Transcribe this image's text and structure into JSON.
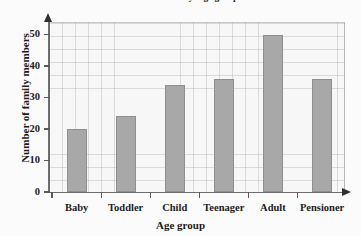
{
  "chart_data": {
    "type": "bar",
    "title": "Numbers in family: age groups",
    "xlabel": "Age group",
    "ylabel": "Number of family members",
    "categories": [
      "Baby",
      "Toddler",
      "Child",
      "Teenager",
      "Adult",
      "Pensioner"
    ],
    "values": [
      20,
      24,
      34,
      36,
      50,
      36
    ],
    "ylim": [
      0,
      54
    ],
    "ytick_labels": [
      "0",
      "10",
      "20",
      "30",
      "40",
      "50"
    ],
    "ytick_values": [
      0,
      10,
      20,
      30,
      40,
      50
    ],
    "grid": true,
    "grid_minor_step": 2,
    "legend": null,
    "bar_color": "#a8a8a8",
    "bar_edge_color": "#8e8e8e",
    "plot_background": "#f7f7f7",
    "grid_color": "#a0a0a0",
    "axis_color": "#6d6d6d",
    "text_color": "#1b1b1b"
  }
}
